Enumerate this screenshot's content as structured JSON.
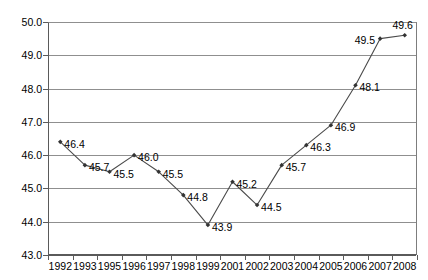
{
  "chart_data": {
    "type": "line",
    "title": "",
    "subtitle": "",
    "xlabel": "",
    "ylabel": "",
    "categories": [
      "1992",
      "1993",
      "1995",
      "1996",
      "1997",
      "1998",
      "1999",
      "2001",
      "2002",
      "2003",
      "2004",
      "2005",
      "2006",
      "2007",
      "2008"
    ],
    "values": [
      46.4,
      45.7,
      45.5,
      46.0,
      45.5,
      44.8,
      43.9,
      45.2,
      44.5,
      45.7,
      46.3,
      46.9,
      48.1,
      49.5,
      49.6
    ],
    "data_labels": [
      "46.4",
      "45.7",
      "45.5",
      "46.0",
      "45.5",
      "44.8",
      "43.9",
      "45.2",
      "44.5",
      "45.7",
      "46.3",
      "46.9",
      "48.1",
      "49.5",
      "49.6"
    ],
    "ylim": [
      43.0,
      50.0
    ],
    "ytick_labels": [
      "50.0",
      "49.0",
      "48.0",
      "47.0",
      "46.0",
      "45.0",
      "44.0",
      "43.0"
    ],
    "ytick_values": [
      50.0,
      49.0,
      48.0,
      47.0,
      46.0,
      45.0,
      44.0,
      43.0
    ],
    "ytick_step": 1.0,
    "grid": true,
    "grid_axis": "y",
    "legend": false,
    "legend_position": "none",
    "series": [
      {
        "name": "",
        "values": [
          46.4,
          45.7,
          45.5,
          46.0,
          45.5,
          44.8,
          43.9,
          45.2,
          44.5,
          45.7,
          46.3,
          46.9,
          48.1,
          49.5,
          49.6
        ],
        "line_color": "#4a4a4a",
        "marker": "diamond",
        "marker_color": "#333333"
      }
    ],
    "colors": {
      "line": "#4a4a4a",
      "marker": "#333333",
      "grid": "#8f8f8f",
      "axis": "#5a5a5a",
      "text": "#000000",
      "background": "#ffffff"
    }
  }
}
